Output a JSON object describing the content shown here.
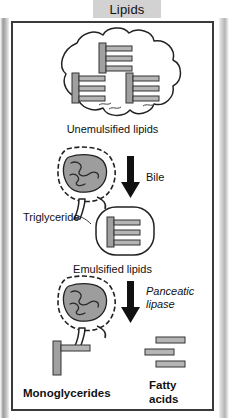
{
  "title": {
    "text": "Lipids"
  },
  "diagram": {
    "name": "lipid-digestion-diagram",
    "steps": [
      {
        "id": "unemulsified",
        "label": "Unemulsified lipids",
        "icon": "lipid-globule-cloud",
        "molecule_count": 3
      },
      {
        "id": "bile-step",
        "label": "Bile",
        "icon": "intestine",
        "arrow": "down-arrow"
      },
      {
        "id": "emulsified",
        "label": "Emulsified lipids",
        "callout": "Triglyceride",
        "icon": "micelle-droplet",
        "molecule_count": 1
      },
      {
        "id": "lipase-step",
        "label": "Panceatic lipase",
        "icon": "intestine",
        "arrow": "down-arrow"
      },
      {
        "id": "products",
        "products": [
          {
            "label": "Monoglycerides",
            "icon": "monoglyceride-molecule"
          },
          {
            "label_line1": "Fatty",
            "label_line2": "acids",
            "icon": "fatty-acid-molecules",
            "count": 3
          }
        ]
      }
    ]
  },
  "colors": {
    "title_chip_bg": "#d2d2d2",
    "panel_border": "#3a3a3a",
    "molecule_fill": "#9e9e9e",
    "organ_fill": "#9a9a9a",
    "arrow": "#111111",
    "background": "#ffffff"
  }
}
